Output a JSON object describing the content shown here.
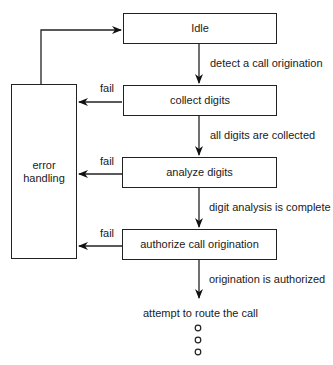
{
  "diagram": {
    "states": [
      {
        "id": "idle",
        "label": "Idle"
      },
      {
        "id": "collect",
        "label": "collect digits"
      },
      {
        "id": "analyze",
        "label": "analyze digits"
      },
      {
        "id": "authorize",
        "label": "authorize call origination"
      }
    ],
    "error_box": {
      "line1": "error",
      "line2": "handling"
    },
    "transitions": [
      {
        "from": "idle",
        "to": "collect",
        "label": "detect a call origination"
      },
      {
        "from": "collect",
        "to": "analyze",
        "label": "all digits are collected"
      },
      {
        "from": "analyze",
        "to": "authorize",
        "label": "digit analysis is complete"
      },
      {
        "from": "authorize",
        "to": "route",
        "label": "origination is authorized"
      }
    ],
    "fail_labels": [
      "fail",
      "fail",
      "fail"
    ],
    "final_step": "attempt to route the call",
    "continuation": "ellipsis-circles"
  }
}
